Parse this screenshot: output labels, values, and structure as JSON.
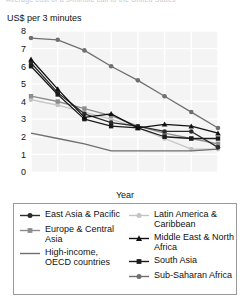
{
  "figure": {
    "cropped_title": "Average cost of a 3-minute call to the United States",
    "unit_label": "US$ per 3 minutes",
    "axis_title_x": "Year"
  },
  "chart_data": {
    "type": "line",
    "title": "Average cost of a 3-minute call to the United States",
    "xlabel": "Year",
    "ylabel": "US$ per 3 minutes",
    "categories": [
      "1997",
      "1998",
      "1999",
      "2000",
      "2001",
      "2002",
      "2003",
      "2004"
    ],
    "x": [
      1997,
      1998,
      1999,
      2000,
      2001,
      2002,
      2003,
      2004
    ],
    "xlim": [
      1997,
      2004
    ],
    "ylim": [
      0,
      8
    ],
    "yticks": [
      "0",
      "1",
      "2",
      "3",
      "4",
      "5",
      "6",
      "7",
      "8"
    ],
    "grid": true,
    "legend_position": "below-plot",
    "series": [
      {
        "name": "East Asia & Pacific",
        "values": [
          6.2,
          4.5,
          3.3,
          2.8,
          2.6,
          2.3,
          2.3,
          1.4
        ],
        "color": "#2b2b2b",
        "marker": "circle",
        "legend_column": "left"
      },
      {
        "name": "Europe & Central Asia",
        "values": [
          4.3,
          4.0,
          3.6,
          3.2,
          2.6,
          2.2,
          1.9,
          1.6
        ],
        "color": "#8d8d8d",
        "marker": "square",
        "legend_column": "left"
      },
      {
        "name": "High-income, OECD countries",
        "values": [
          2.2,
          1.9,
          1.6,
          1.2,
          1.2,
          1.2,
          1.2,
          1.3
        ],
        "color": "#6e6e6e",
        "marker": "none",
        "legend_column": "left"
      },
      {
        "name": "Latin America & Caribbean",
        "values": [
          4.1,
          3.8,
          3.4,
          3.0,
          2.5,
          1.9,
          1.3,
          1.3
        ],
        "color": "#c4c4c4",
        "marker": "circle",
        "legend_column": "right"
      },
      {
        "name": "Middle East & North Africa",
        "values": [
          6.4,
          4.7,
          3.1,
          3.3,
          2.5,
          2.7,
          2.6,
          2.2
        ],
        "color": "#111111",
        "marker": "triangle",
        "legend_column": "right"
      },
      {
        "name": "South Asia",
        "values": [
          6.0,
          4.4,
          3.0,
          2.6,
          2.5,
          2.0,
          1.9,
          1.9
        ],
        "color": "#1c1c1c",
        "marker": "square",
        "legend_column": "right"
      },
      {
        "name": "Sub-Saharan Africa",
        "values": [
          7.6,
          7.5,
          6.9,
          6.0,
          5.2,
          4.3,
          3.4,
          2.5
        ],
        "color": "#707070",
        "marker": "circle",
        "legend_column": "right"
      }
    ]
  },
  "legend": {
    "left": [
      {
        "label": "East Asia & Pacific",
        "color": "#2b2b2b",
        "marker": "circle"
      },
      {
        "label": "Europe & Central Asia",
        "color": "#8d8d8d",
        "marker": "square"
      },
      {
        "label": "High-income, OECD countries",
        "color": "#6e6e6e",
        "marker": "none"
      }
    ],
    "right": [
      {
        "label": "Latin America & Caribbean",
        "color": "#c4c4c4",
        "marker": "circle"
      },
      {
        "label": "Middle East & North Africa",
        "color": "#111111",
        "marker": "triangle"
      },
      {
        "label": "South Asia",
        "color": "#1c1c1c",
        "marker": "square"
      },
      {
        "label": "Sub-Saharan Africa",
        "color": "#707070",
        "marker": "circle"
      }
    ]
  }
}
